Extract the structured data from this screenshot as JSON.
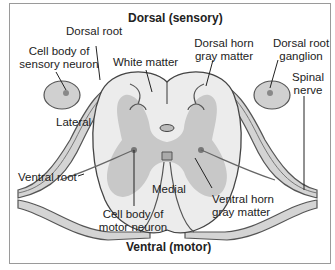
{
  "title_top": "Dorsal (sensory)",
  "title_bottom": "Ventral (motor)",
  "labels": {
    "dorsal_root": "Dorsal root",
    "cell_body_sensory_1": "Cell body of",
    "cell_body_sensory_2": "sensory neuron",
    "white_matter": "White matter",
    "dorsal_horn_1": "Dorsal horn",
    "dorsal_horn_2": "gray matter",
    "drg_1": "Dorsal root",
    "drg_2": "ganglion",
    "spinal_nerve_1": "Spinal",
    "spinal_nerve_2": "nerve",
    "lateral": "Lateral",
    "ventral_root": "Ventral root",
    "medial": "Medial",
    "cell_body_motor_1": "Cell body of",
    "cell_body_motor_2": "motor neuron",
    "ventral_horn_1": "Ventral horn",
    "ventral_horn_2": "gray matter"
  },
  "colors": {
    "white_matter": "#ececec",
    "gray_matter": "#c8c8c8",
    "nerve_fill": "#d4d4d4",
    "outline": "#555555"
  }
}
